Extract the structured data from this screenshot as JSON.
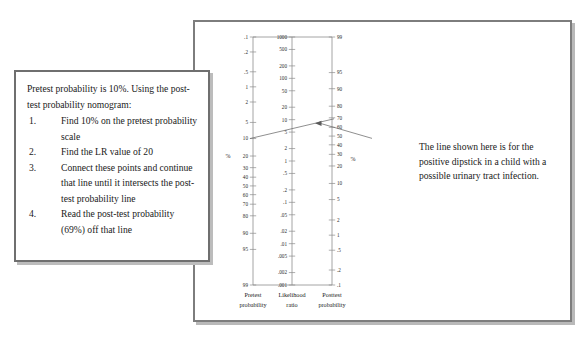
{
  "instructions": {
    "intro": "Pretest probability is 10%. Using the post-test probability nomogram:",
    "steps": [
      {
        "num": "1.",
        "text": "Find 10% on the pretest probability scale"
      },
      {
        "num": "2.",
        "text": "Find the LR value of 20"
      },
      {
        "num": "3.",
        "text": "Connect these points and continue that line until it intersects the post-test probability line"
      },
      {
        "num": "4.",
        "text": "Read the post-test probability (69%) off that line"
      }
    ]
  },
  "annotation": {
    "text": "The line shown here is for the positive dipstick in a child with a possible urinary tract infection."
  },
  "nomogram": {
    "footer": {
      "pretest": "Pretest probability",
      "likelihood": "Likelihood ratio",
      "posttest": "Posttest probability"
    },
    "percent_symbol": "%",
    "colors": {
      "axis": "#8d8d8d",
      "line": "#6a6a6a",
      "frame": "#7d7d7d",
      "text": "#1a1a1a"
    }
  },
  "chart_data": {
    "type": "line",
    "xlabel": "",
    "ylabel": "",
    "grid": false,
    "legend_position": "none",
    "axes": [
      {
        "name": "pretest_probability",
        "label": "Pretest probability",
        "unit": "%",
        "orientation": "vertical",
        "direction": "increasing-downward",
        "ticks": [
          {
            "value": 0.1,
            "label": ".1"
          },
          {
            "value": 0.2,
            "label": ".2"
          },
          {
            "value": 0.5,
            "label": ".5"
          },
          {
            "value": 1,
            "label": "1"
          },
          {
            "value": 2,
            "label": "2"
          },
          {
            "value": 5,
            "label": "5"
          },
          {
            "value": 10,
            "label": "10"
          },
          {
            "value": 20,
            "label": "20"
          },
          {
            "value": 30,
            "label": "30"
          },
          {
            "value": 40,
            "label": "40"
          },
          {
            "value": 50,
            "label": "50"
          },
          {
            "value": 60,
            "label": "60"
          },
          {
            "value": 70,
            "label": "70"
          },
          {
            "value": 80,
            "label": "80"
          },
          {
            "value": 90,
            "label": "90"
          },
          {
            "value": 95,
            "label": "95"
          },
          {
            "value": 99,
            "label": "99"
          }
        ]
      },
      {
        "name": "likelihood_ratio",
        "label": "Likelihood ratio",
        "unit": "",
        "orientation": "vertical",
        "direction": "decreasing-downward",
        "ticks": [
          {
            "value": 1000,
            "label": "1000"
          },
          {
            "value": 500,
            "label": "500"
          },
          {
            "value": 200,
            "label": "200"
          },
          {
            "value": 100,
            "label": "100"
          },
          {
            "value": 50,
            "label": "50"
          },
          {
            "value": 20,
            "label": "20"
          },
          {
            "value": 10,
            "label": "10"
          },
          {
            "value": 5,
            "label": "5"
          },
          {
            "value": 2,
            "label": "2"
          },
          {
            "value": 1,
            "label": "1"
          },
          {
            "value": 0.5,
            "label": ".5"
          },
          {
            "value": 0.2,
            "label": ".2"
          },
          {
            "value": 0.1,
            "label": ".1"
          },
          {
            "value": 0.05,
            "label": ".05"
          },
          {
            "value": 0.02,
            "label": ".02"
          },
          {
            "value": 0.01,
            "label": ".01"
          },
          {
            "value": 0.005,
            "label": ".005"
          },
          {
            "value": 0.002,
            "label": ".002"
          },
          {
            "value": 0.001,
            "label": ".001"
          }
        ]
      },
      {
        "name": "posttest_probability",
        "label": "Posttest probability",
        "unit": "%",
        "orientation": "vertical",
        "direction": "decreasing-downward",
        "ticks": [
          {
            "value": 99,
            "label": "99"
          },
          {
            "value": 95,
            "label": "95"
          },
          {
            "value": 90,
            "label": "90"
          },
          {
            "value": 80,
            "label": "80"
          },
          {
            "value": 70,
            "label": "70"
          },
          {
            "value": 60,
            "label": "60"
          },
          {
            "value": 50,
            "label": "50"
          },
          {
            "value": 40,
            "label": "40"
          },
          {
            "value": 30,
            "label": "30"
          },
          {
            "value": 20,
            "label": "20"
          },
          {
            "value": 10,
            "label": "10"
          },
          {
            "value": 5,
            "label": "5"
          },
          {
            "value": 2,
            "label": "2"
          },
          {
            "value": 1,
            "label": "1"
          },
          {
            "value": 0.5,
            "label": ".5"
          },
          {
            "value": 0.2,
            "label": ".2"
          },
          {
            "value": 0.1,
            "label": ".1"
          }
        ]
      }
    ],
    "series": [
      {
        "name": "positive dipstick in a child with possible UTI",
        "pretest_probability": 10,
        "likelihood_ratio": 20,
        "posttest_probability": 69
      }
    ],
    "annotations": [
      {
        "text": "The line shown here is for the positive dipstick in a child with a possible urinary tract infection.",
        "points_to": "nomogram-line"
      }
    ]
  }
}
